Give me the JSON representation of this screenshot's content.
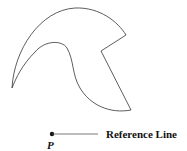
{
  "diagram": {
    "shape_label": "crescent-hook shape",
    "point_label": "P",
    "reference_label": "Reference Line",
    "colors": {
      "stroke": "#333333",
      "text": "#111111",
      "background": "#ffffff"
    }
  }
}
